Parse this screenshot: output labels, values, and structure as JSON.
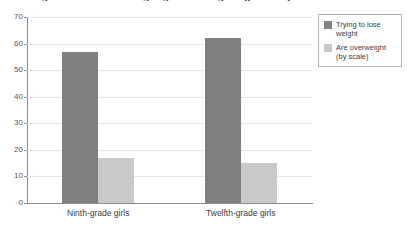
{
  "chart_data": {
    "type": "bar",
    "title": "Weight concerns among high school girls (percent)",
    "title_truncated": true,
    "xlabel": "",
    "ylabel": "",
    "categories": [
      "Ninth-grade girls",
      "Twelfth-grade girls"
    ],
    "series": [
      {
        "name": "Trying to lose weight",
        "values": [
          57,
          62
        ],
        "color": "#808080"
      },
      {
        "name": "Are overweight (by scale)",
        "values": [
          17,
          15
        ],
        "color": "#c9c9c9"
      }
    ],
    "ylim": [
      0,
      70
    ],
    "ytick_values": [
      0,
      10,
      20,
      30,
      40,
      50,
      60,
      70
    ],
    "ytick_labels": [
      "0",
      "10",
      "20",
      "30",
      "40",
      "50",
      "60",
      "70"
    ],
    "grid": true,
    "grid_axis": "y",
    "legend_position": "top-right",
    "legend_entries": [
      {
        "label_line1": "Trying to lose",
        "label_line2": "weight",
        "swatch": "dark"
      },
      {
        "label_line1": "Are overweight",
        "label_line2": "(by scale)",
        "swatch": "light"
      }
    ]
  },
  "colors": {
    "series_dark": "#808080",
    "series_light": "#c9c9c9",
    "gridline": "#e6e6e6",
    "axis": "#8c8c8c",
    "text": "#3c3c3c",
    "background": "#ffffff"
  }
}
